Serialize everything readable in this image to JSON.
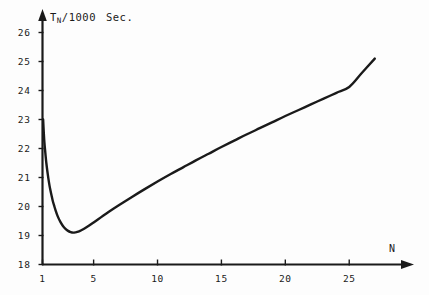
{
  "chart_data": {
    "type": "line",
    "title": "",
    "xlabel": "N",
    "ylabel_main": "T",
    "ylabel_sub": "N",
    "ylabel_rest": "/1000",
    "ylabel_units": "Sec.",
    "xlim": [
      1,
      28
    ],
    "ylim": [
      18,
      26.6
    ],
    "grid": false,
    "legend": null,
    "xticks": [
      1,
      5,
      10,
      15,
      20,
      25
    ],
    "xtick_labels": [
      "1",
      "5",
      "10",
      "15",
      "20",
      "25"
    ],
    "yticks": [
      18,
      19,
      20,
      21,
      22,
      23,
      24,
      25,
      26
    ],
    "ytick_labels": [
      "18",
      "19",
      "20",
      "21",
      "22",
      "23",
      "24",
      "25",
      "26"
    ],
    "series": [
      {
        "name": "T_N/1000",
        "color": "#1a1a1a",
        "x": [
          1.05,
          1.1,
          1.15,
          1.2,
          1.3,
          1.4,
          1.5,
          1.6,
          1.7,
          1.8,
          1.9,
          2.0,
          2.2,
          2.4,
          2.6,
          2.8,
          3.0,
          3.2,
          3.4,
          3.6,
          3.8,
          4.0,
          4.5,
          5.0,
          6.0,
          7.0,
          8.0,
          9.0,
          10.0,
          11.0,
          12.0,
          13.0,
          14.0,
          15.0,
          16.0,
          17.0,
          18.0,
          19.0,
          20.0,
          21.0,
          22.0,
          23.0,
          24.0,
          25.0,
          26.0,
          27.0
        ],
        "y": [
          23.0,
          22.55,
          22.2,
          21.95,
          21.5,
          21.15,
          20.85,
          20.6,
          20.4,
          20.2,
          20.05,
          19.9,
          19.65,
          19.47,
          19.33,
          19.23,
          19.16,
          19.12,
          19.1,
          19.11,
          19.13,
          19.17,
          19.3,
          19.45,
          19.76,
          20.05,
          20.33,
          20.6,
          20.86,
          21.11,
          21.35,
          21.59,
          21.82,
          22.05,
          22.27,
          22.49,
          22.7,
          22.91,
          23.12,
          23.32,
          23.52,
          23.72,
          23.92,
          24.12,
          24.61,
          25.1
        ],
        "minimum": {
          "x": 3.4,
          "y": 19.1
        }
      }
    ]
  },
  "axes": {
    "x_axis_name": "N",
    "y_axis_name": "T_N/1000 Sec."
  }
}
